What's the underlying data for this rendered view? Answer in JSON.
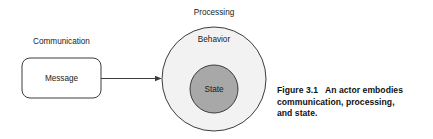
{
  "figure": {
    "caption_lines": [
      "Figure 3.1   An actor embodies",
      "communication, processing,",
      "and state."
    ]
  },
  "diagram": {
    "type": "concept-diagram",
    "labels": {
      "communication": "Communication",
      "processing": "Processing",
      "message": "Message",
      "behavior": "Behavior",
      "state": "State"
    },
    "colors": {
      "stroke": "#3c3c3c",
      "outer_circle_fill": "#f2f2f2",
      "inner_circle_fill": "#a8a8a8",
      "box_fill": "#ffffff",
      "text": "#1a1a1a",
      "caption_text": "#111111",
      "background": "#ffffff"
    },
    "shapes": {
      "message_box": {
        "x": 22,
        "y": 58,
        "width": 79,
        "height": 40,
        "corner_radius": 8
      },
      "outer_circle": {
        "cx": 214,
        "cy": 79,
        "r": 52
      },
      "inner_circle": {
        "cx": 214,
        "cy": 89,
        "r": 24
      },
      "arrow": {
        "x1": 101,
        "y1": 78,
        "x2": 162,
        "y2": 78
      }
    }
  }
}
